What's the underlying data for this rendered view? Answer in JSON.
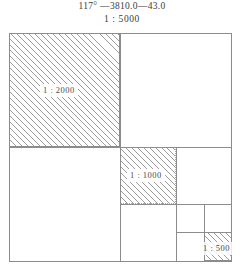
{
  "header": {
    "title": "117° —3810.0—43.0",
    "subtitle": "1 : 5000"
  },
  "diagram": {
    "type": "nested-map-sheet-subdivision",
    "outer_scale_label": "1 : 5000",
    "regions": [
      {
        "name": "scale-2000-region",
        "label": "1 : 2000",
        "hatched": true,
        "quadrant": "top-left",
        "level": 1
      },
      {
        "name": "scale-1000-region",
        "label": "1 : 1000",
        "hatched": true,
        "quadrant": "bottom-right > top-left",
        "level": 2
      },
      {
        "name": "scale-500-region",
        "label": "1 : 500",
        "hatched": true,
        "quadrant": "bottom-right > bottom-right > bottom-right",
        "level": 3
      }
    ],
    "colors": {
      "line": "#8c8c8c",
      "hatch": "#9b9b9b",
      "text": "#3c3c3c",
      "background": "#ffffff"
    }
  }
}
